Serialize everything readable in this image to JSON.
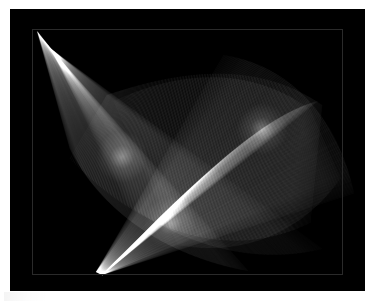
{
  "figure": {
    "caption": "",
    "width": 375,
    "height": 304,
    "paper_color": "#ffffff",
    "panel_color": "#000000",
    "axes_frame_color": "#2a2a2a",
    "line_color": "#ffffff",
    "panel": {
      "x": 10,
      "y": 9,
      "width": 355,
      "height": 282
    },
    "axes_box": {
      "x": 22,
      "y": 20,
      "width": 311,
      "height": 246
    }
  },
  "chart_data": {
    "type": "line",
    "subtitle": "",
    "xlabel": "",
    "ylabel": "",
    "xlim": [
      0,
      355
    ],
    "ylim": [
      0,
      282
    ],
    "grid": false,
    "legend_position": "none",
    "background": "#000000",
    "stroke": "#ffffff",
    "render": {
      "mode": "segment-family-envelope",
      "blend": "screen-additive",
      "segment_count": 520,
      "base_alpha": 0.085,
      "line_width": 0.65,
      "anti_alias": true,
      "parameter_range": [
        0,
        1
      ]
    },
    "series": [
      {
        "name": "family-A-left-fan",
        "count": 170,
        "alpha": 0.075,
        "anchor_curve": {
          "name": "pencil-point-upper-left",
          "type": "point-drift",
          "p0": [
            27,
            22
          ],
          "p1": [
            41,
            40
          ]
        },
        "target_curve": {
          "name": "lower-left-arc",
          "type": "cubic",
          "points": [
            [
              60,
              140
            ],
            [
              96,
              212
            ],
            [
              170,
              250
            ],
            [
              238,
              262
            ]
          ]
        },
        "t_values": [
          0,
          0.25,
          0.5,
          0.75,
          1
        ]
      },
      {
        "name": "family-B-bottom-pencil",
        "count": 175,
        "alpha": 0.09,
        "anchor_curve": {
          "name": "pencil-point-lower",
          "type": "point-drift",
          "p0": [
            86,
            263
          ],
          "p1": [
            92,
            266
          ]
        },
        "target_curve": {
          "name": "upper-right-arc",
          "type": "cubic",
          "points": [
            [
              214,
              46
            ],
            [
              288,
              58
            ],
            [
              330,
              118
            ],
            [
              344,
              184
            ]
          ]
        },
        "t_values": [
          0,
          0.25,
          0.5,
          0.75,
          1
        ]
      },
      {
        "name": "family-C-upper-sweep",
        "count": 175,
        "alpha": 0.085,
        "anchor_curve": {
          "name": "top-edge-sweep",
          "type": "cubic",
          "points": [
            [
              97,
              86
            ],
            [
              168,
              62
            ],
            [
              246,
              50
            ],
            [
              312,
              96
            ]
          ]
        },
        "target_curve": {
          "name": "bottom-edge-sweep",
          "type": "cubic",
          "points": [
            [
              60,
              150
            ],
            [
              140,
              232
            ],
            [
              226,
              250
            ],
            [
              300,
              214
            ]
          ]
        },
        "t_values": [
          0,
          0.25,
          0.5,
          0.75,
          1
        ]
      }
    ],
    "annotations": [
      {
        "name": "bright-focus-left",
        "x": 112,
        "y": 148,
        "label": ""
      },
      {
        "name": "bright-focus-right",
        "x": 252,
        "y": 120,
        "label": ""
      },
      {
        "name": "dark-lens-gap",
        "x": 214,
        "y": 122,
        "label": ""
      },
      {
        "name": "cusp-lower-center",
        "x": 160,
        "y": 214,
        "label": ""
      }
    ],
    "brightness_range": [
      0,
      255
    ],
    "peak_brightness": 252,
    "mean_background_brightness": 3
  }
}
